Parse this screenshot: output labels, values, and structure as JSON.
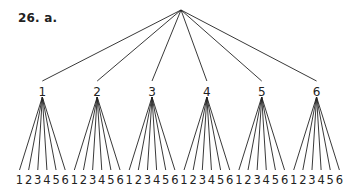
{
  "problem_label": "26.  a.",
  "tree": {
    "root": "",
    "level1": [
      "1",
      "2",
      "3",
      "4",
      "5",
      "6"
    ],
    "level2": [
      "1",
      "2",
      "3",
      "4",
      "5",
      "6"
    ]
  },
  "colors": {
    "ink": "#222222",
    "background": "#ffffff"
  }
}
